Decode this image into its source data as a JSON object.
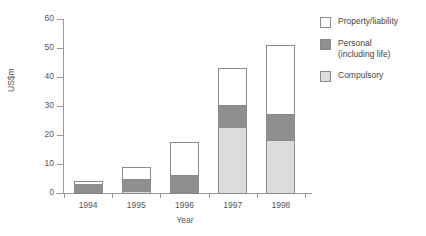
{
  "chart_data": {
    "type": "bar",
    "subtype": "stacked-vertical",
    "title": "",
    "xlabel": "Year",
    "ylabel": "US$m",
    "categories": [
      "1994",
      "1995",
      "1996",
      "1997",
      "1998"
    ],
    "ylim": [
      0,
      60
    ],
    "yticks": [
      0,
      10,
      20,
      30,
      40,
      50,
      60
    ],
    "ytick_labels": [
      "0",
      "10",
      "20",
      "30",
      "40",
      "50",
      "60"
    ],
    "grid": false,
    "legend_position": "right",
    "series": [
      {
        "name": "Compulsory",
        "color": "#dcdcdc",
        "values": [
          0,
          1,
          0.7,
          23,
          18.7
        ]
      },
      {
        "name": "Personal\n(including life)",
        "color": "#8f8f8f",
        "values": [
          3.6,
          4.5,
          6.3,
          8,
          9.3
        ]
      },
      {
        "name": "Property/liability",
        "color": "#ffffff",
        "values": [
          1.4,
          4.5,
          11.5,
          13,
          24
        ]
      }
    ],
    "totals": [
      5,
      10,
      18.5,
      44,
      52
    ],
    "annotations": []
  },
  "axes": {
    "y_title": "US$m",
    "x_title": "Year"
  },
  "legend": {
    "items": [
      {
        "label": "Property/liability",
        "swatch": "#ffffff",
        "swatch_name": "legend-swatch-property-liability"
      },
      {
        "label": "Personal\n(including life)",
        "swatch": "#8f8f8f",
        "swatch_name": "legend-swatch-personal"
      },
      {
        "label": "Compulsory",
        "swatch": "#dcdcdc",
        "swatch_name": "legend-swatch-compulsory"
      }
    ]
  },
  "colors": {
    "property_liability": "#ffffff",
    "personal": "#8f8f8f",
    "compulsory": "#dcdcdc",
    "axis": "#9a9a9a",
    "text": "#555555",
    "background": "#ffffff"
  }
}
